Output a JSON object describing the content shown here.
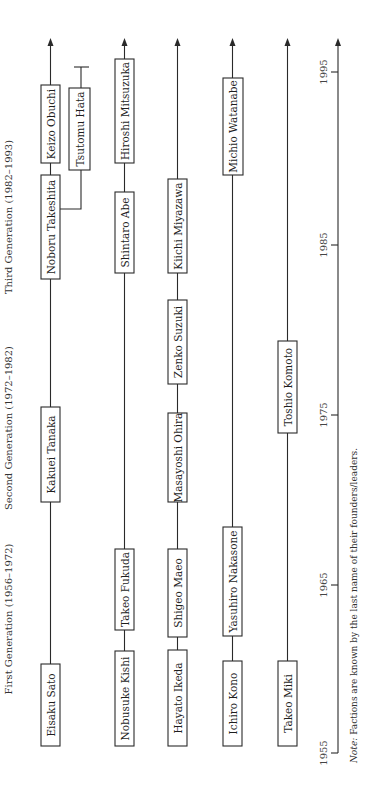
{
  "diagram": {
    "title_orientation": "rotated 90 degrees counterclockwise; time runs bottom-to-top",
    "generations": [
      {
        "label": "First Generation (1956–1972)"
      },
      {
        "label": "Second Generation (1972–1982)"
      },
      {
        "label": "Third Generation (1982–1993)"
      }
    ],
    "axis": {
      "ticks": [
        {
          "label": "1955"
        },
        {
          "label": "1965"
        },
        {
          "label": "1975"
        },
        {
          "label": "1985"
        },
        {
          "label": "1995"
        }
      ]
    },
    "lineages": [
      {
        "name": "Sato-Tanaka-Takeshita line",
        "leaders": [
          {
            "label": "Eisaku Sato"
          },
          {
            "label": "Kakuei Tanaka"
          },
          {
            "label": "Noboru Takeshita"
          },
          {
            "label": "Keizo Obuchi"
          }
        ],
        "branch": {
          "label": "Tsutomu Hata",
          "from": "Noboru Takeshita",
          "ended": true
        }
      },
      {
        "name": "Kishi-Fukuda line",
        "leaders": [
          {
            "label": "Nobusuke Kishi"
          },
          {
            "label": "Takeo Fukuda"
          },
          {
            "label": "Shintaro Abe"
          },
          {
            "label": "Hiroshi Mitsuzuka"
          }
        ]
      },
      {
        "name": "Ikeda line",
        "leaders": [
          {
            "label": "Hayato Ikeda"
          },
          {
            "label": "Shigeo Maeo"
          },
          {
            "label": "Masayoshi Ohira"
          },
          {
            "label": "Zenko Suzuki"
          },
          {
            "label": "Kiichi Miyazawa"
          }
        ]
      },
      {
        "name": "Kono line",
        "leaders": [
          {
            "label": "Ichiro Kono"
          },
          {
            "label": "Yasuhiro Nakasone"
          },
          {
            "label": "Michio Watanabe"
          }
        ]
      },
      {
        "name": "Miki line",
        "leaders": [
          {
            "label": "Takeo Miki"
          },
          {
            "label": "Toshio Komoto"
          }
        ]
      }
    ],
    "note": {
      "prefix": "Note:",
      "text": " Factions are known by the last name of their founders/leaders."
    }
  }
}
